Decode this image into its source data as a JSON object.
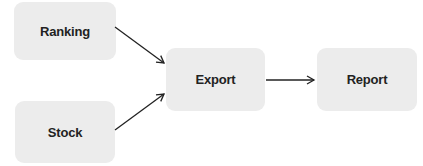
{
  "diagram": {
    "nodes": [
      {
        "id": "ranking",
        "label": "Ranking"
      },
      {
        "id": "stock",
        "label": "Stock"
      },
      {
        "id": "export",
        "label": "Export"
      },
      {
        "id": "report",
        "label": "Report"
      }
    ],
    "edges": [
      {
        "from": "ranking",
        "to": "export"
      },
      {
        "from": "stock",
        "to": "export"
      },
      {
        "from": "export",
        "to": "report"
      }
    ],
    "colors": {
      "node_fill": "#ececec",
      "arrow": "#222222",
      "text": "#222222"
    }
  }
}
